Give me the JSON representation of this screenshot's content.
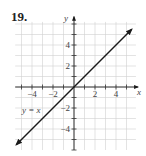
{
  "problem": {
    "number": "19."
  },
  "chart_data": {
    "type": "line",
    "title": "",
    "xlabel": "x",
    "ylabel": "y",
    "xlim": [
      -5.5,
      6
    ],
    "ylim": [
      -6,
      6
    ],
    "grid": true,
    "x_ticks": [
      -4,
      -2,
      2,
      4
    ],
    "y_ticks": [
      4,
      2,
      -2,
      -4
    ],
    "x_tick_labels": [
      "−4",
      "−2",
      "2",
      "4"
    ],
    "y_tick_labels": [
      "4",
      "2",
      "−2",
      "−4"
    ],
    "series": [
      {
        "name": "y = x",
        "x": [
          -5.5,
          5.5
        ],
        "y": [
          -5.5,
          5.5
        ],
        "arrows": "both"
      }
    ],
    "annotations": [
      {
        "text": "y = x",
        "x": -4,
        "y": -2.5
      }
    ]
  },
  "colors": {
    "grid": "#d0d0d0",
    "axis": "#333333",
    "line": "#1a1a1a"
  }
}
